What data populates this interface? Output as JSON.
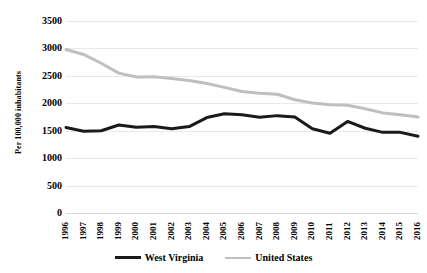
{
  "chart_data": {
    "type": "line",
    "title": "",
    "subtitle": "",
    "xlabel": "",
    "ylabel": "Per 100,000 inhabitants",
    "x": [
      1996,
      1997,
      1998,
      1999,
      2000,
      2001,
      2002,
      2003,
      2004,
      2005,
      2006,
      2007,
      2008,
      2009,
      2010,
      2011,
      2012,
      2013,
      2014,
      2015,
      2016
    ],
    "categories": [
      "1996",
      "1997",
      "1998",
      "1999",
      "2000",
      "2001",
      "2002",
      "2003",
      "2004",
      "2005",
      "2006",
      "2007",
      "2008",
      "2009",
      "2010",
      "2011",
      "2012",
      "2013",
      "2014",
      "2015",
      "2016"
    ],
    "series": [
      {
        "name": "West Virginia",
        "color": "#1a1a1a",
        "line_width": 3,
        "values": [
          1560,
          1490,
          1500,
          1605,
          1565,
          1575,
          1535,
          1575,
          1740,
          1810,
          1790,
          1745,
          1775,
          1750,
          1535,
          1455,
          1670,
          1545,
          1470,
          1470,
          1400
        ]
      },
      {
        "name": "United States",
        "color": "#bfbfbf",
        "line_width": 3,
        "values": [
          2980,
          2890,
          2730,
          2550,
          2480,
          2485,
          2450,
          2415,
          2360,
          2290,
          2215,
          2185,
          2165,
          2065,
          2005,
          1975,
          1965,
          1900,
          1825,
          1790,
          1750
        ]
      }
    ],
    "ylim": [
      0,
      3500
    ],
    "ytick_step": 500,
    "yticks": [
      "3500",
      "3000",
      "2500",
      "2000",
      "1500",
      "1000",
      "500",
      "0"
    ],
    "grid": true,
    "grid_color": "#e9e9e9",
    "legend_position": "bottom"
  },
  "legend": {
    "entries": [
      {
        "label": "West Virginia",
        "color": "#1a1a1a"
      },
      {
        "label": "United States",
        "color": "#bfbfbf"
      }
    ]
  }
}
